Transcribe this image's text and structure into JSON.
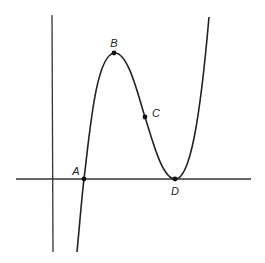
{
  "diagram": {
    "type": "cubic function graph",
    "axes": {
      "x_axis": {
        "x1": 16,
        "y1": 179,
        "x2": 251,
        "y2": 179
      },
      "y_axis": {
        "x1": 52,
        "y1": 15,
        "x2": 53,
        "y2": 252
      }
    },
    "curve": {
      "path": "M 77 252 C 80 220, 82 195, 84 179 C 90 130, 96 56, 114 53 C 128 51, 138 95, 145 117 C 152 139, 162 179, 175 179 C 190 180, 200 120, 209 17"
    },
    "points": [
      {
        "id": "A",
        "label": "A",
        "x": 84,
        "y": 179,
        "label_x": 76,
        "label_y": 175,
        "anchor": "middle"
      },
      {
        "id": "B",
        "label": "B",
        "x": 114,
        "y": 53,
        "label_x": 114,
        "label_y": 47,
        "anchor": "middle"
      },
      {
        "id": "C",
        "label": "C",
        "x": 145,
        "y": 117,
        "label_x": 152,
        "label_y": 117,
        "anchor": "start"
      },
      {
        "id": "D",
        "label": "D",
        "x": 175,
        "y": 179,
        "label_x": 175,
        "label_y": 195,
        "anchor": "middle"
      }
    ],
    "colors": {
      "line": "#222222",
      "background": "#ffffff"
    }
  }
}
